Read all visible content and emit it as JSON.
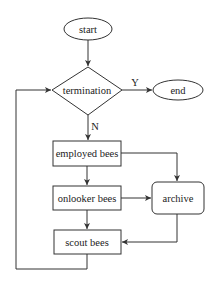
{
  "diagram": {
    "nodes": {
      "start": {
        "label": "start",
        "shape": "ellipse"
      },
      "termination": {
        "label": "termination",
        "shape": "diamond"
      },
      "end": {
        "label": "end",
        "shape": "ellipse"
      },
      "employed": {
        "label": "employed bees",
        "shape": "rect"
      },
      "onlooker": {
        "label": "onlooker bees",
        "shape": "rect"
      },
      "archive": {
        "label": "archive",
        "shape": "rounded-rect"
      },
      "scout": {
        "label": "scout bees",
        "shape": "rect"
      }
    },
    "edge_labels": {
      "yes": "Y",
      "no": "N"
    },
    "edges": [
      {
        "from": "start",
        "to": "termination"
      },
      {
        "from": "termination",
        "to": "end",
        "label": "Y"
      },
      {
        "from": "termination",
        "to": "employed",
        "label": "N"
      },
      {
        "from": "employed",
        "to": "onlooker"
      },
      {
        "from": "employed",
        "to": "archive"
      },
      {
        "from": "onlooker",
        "to": "archive"
      },
      {
        "from": "onlooker",
        "to": "scout"
      },
      {
        "from": "archive",
        "to": "scout"
      },
      {
        "from": "scout",
        "to": "termination"
      }
    ],
    "colors": {
      "stroke": "#333333",
      "background": "#ffffff",
      "text": "#222222"
    }
  }
}
